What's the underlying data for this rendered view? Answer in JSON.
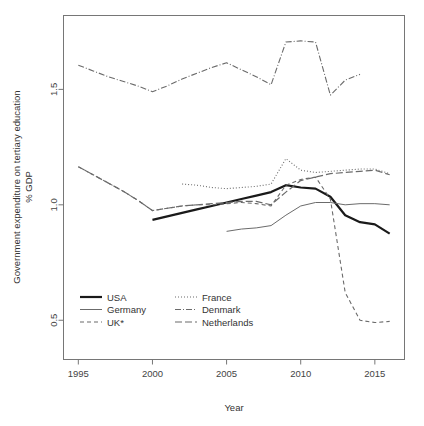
{
  "chart_data": {
    "type": "line",
    "title": "",
    "xlabel": "Year",
    "ylabel": "Government expenditure on tertiary education\n% GDP",
    "ylabel_line1": "Government expenditure on tertiary education",
    "ylabel_line2": "% GDP",
    "xlim": [
      1994,
      2017
    ],
    "ylim": [
      0.33,
      1.82
    ],
    "grid": false,
    "legend_position": "bottom-left",
    "xticks": [
      1995,
      2000,
      2005,
      2010,
      2015
    ],
    "xtick_labels": [
      "1995",
      "2000",
      "2005",
      "2010",
      "2015"
    ],
    "yticks": [
      0.5,
      1.0,
      1.5
    ],
    "ytick_labels": [
      "0.5",
      "1.0",
      "1.5"
    ],
    "series": [
      {
        "name": "USA",
        "style": "solid-thick",
        "color": "#1a1a1a",
        "width": 2.2,
        "dash": "",
        "x": [
          2000,
          2001,
          2002,
          2003,
          2004,
          2005,
          2006,
          2007,
          2008,
          2009,
          2010,
          2011,
          2012,
          2013,
          2014,
          2015,
          2016
        ],
        "y": [
          0.935,
          0.95,
          0.965,
          0.98,
          0.995,
          1.01,
          1.025,
          1.04,
          1.055,
          1.085,
          1.075,
          1.07,
          1.035,
          0.955,
          0.925,
          0.915,
          0.875
        ]
      },
      {
        "name": "Germany",
        "style": "solid-thin",
        "color": "#6b6b6b",
        "width": 1.0,
        "dash": "",
        "x": [
          2005,
          2006,
          2007,
          2008,
          2009,
          2010,
          2011,
          2012,
          2013,
          2014,
          2015,
          2016
        ],
        "y": [
          0.885,
          0.895,
          0.9,
          0.91,
          0.955,
          0.995,
          1.01,
          1.01,
          1.0,
          1.005,
          1.005,
          1.0
        ]
      },
      {
        "name": "UK*",
        "style": "dashed",
        "color": "#6b6b6b",
        "width": 1.1,
        "dash": "4,3",
        "x": [
          1995,
          1996,
          1997,
          1998,
          1999,
          2000,
          2001,
          2002,
          2003,
          2004,
          2005,
          2006,
          2007,
          2008,
          2009,
          2010,
          2011,
          2012,
          2013,
          2014,
          2015,
          2016
        ],
        "y": [
          1.165,
          1.13,
          1.095,
          1.06,
          1.02,
          0.975,
          0.985,
          0.995,
          1.0,
          1.0,
          1.005,
          1.01,
          1.005,
          0.995,
          1.085,
          1.11,
          1.12,
          1.025,
          0.62,
          0.5,
          0.49,
          0.495
        ]
      },
      {
        "name": "France",
        "style": "dotted",
        "color": "#6b6b6b",
        "width": 1.1,
        "dash": "1,2",
        "x": [
          2002,
          2003,
          2004,
          2005,
          2006,
          2007,
          2008,
          2009,
          2010,
          2011,
          2012,
          2013,
          2014,
          2015,
          2016
        ],
        "y": [
          1.09,
          1.085,
          1.075,
          1.07,
          1.075,
          1.08,
          1.09,
          1.2,
          1.15,
          1.14,
          1.145,
          1.15,
          1.155,
          1.155,
          1.135
        ]
      },
      {
        "name": "Denmark",
        "style": "dash-dot",
        "color": "#6b6b6b",
        "width": 1.1,
        "dash": "6,2,1,2",
        "x": [
          1995,
          1996,
          1997,
          1998,
          1999,
          2000,
          2001,
          2002,
          2003,
          2004,
          2005,
          2006,
          2007,
          2008,
          2009,
          2010,
          2011,
          2012,
          2013,
          2014
        ],
        "y": [
          1.605,
          1.58,
          1.555,
          1.535,
          1.515,
          1.49,
          1.515,
          1.545,
          1.57,
          1.595,
          1.615,
          1.585,
          1.555,
          1.52,
          1.705,
          1.71,
          1.705,
          1.475,
          1.54,
          1.565
        ]
      },
      {
        "name": "Netherlands",
        "style": "long-dash",
        "color": "#6b6b6b",
        "width": 1.2,
        "dash": "7,3",
        "x": [
          1995,
          1996,
          1997,
          1998,
          1999,
          2000,
          2001,
          2002,
          2003,
          2004,
          2005,
          2006,
          2007,
          2008,
          2009,
          2010,
          2011,
          2012,
          2013,
          2014,
          2015,
          2016
        ],
        "y": [
          1.165,
          1.13,
          1.095,
          1.06,
          1.02,
          0.975,
          0.985,
          0.995,
          1.0,
          1.005,
          1.01,
          1.015,
          1.015,
          1.0,
          1.055,
          1.105,
          1.12,
          1.135,
          1.14,
          1.145,
          1.15,
          1.13
        ]
      }
    ],
    "legend_entries": [
      {
        "label": "USA",
        "style": "solid-thick",
        "dash": "",
        "width": 2.2,
        "color": "#1a1a1a",
        "col": 0,
        "row": 0
      },
      {
        "label": "Germany",
        "style": "solid-thin",
        "dash": "",
        "width": 1.0,
        "color": "#6b6b6b",
        "col": 0,
        "row": 1
      },
      {
        "label": "UK*",
        "style": "dashed",
        "dash": "4,3",
        "width": 1.1,
        "color": "#6b6b6b",
        "col": 0,
        "row": 2
      },
      {
        "label": "France",
        "style": "dotted",
        "dash": "1,2",
        "width": 1.1,
        "color": "#6b6b6b",
        "col": 1,
        "row": 0
      },
      {
        "label": "Denmark",
        "style": "dash-dot",
        "dash": "6,2,1,2",
        "width": 1.1,
        "color": "#6b6b6b",
        "col": 1,
        "row": 1
      },
      {
        "label": "Netherlands",
        "style": "long-dash",
        "dash": "7,3",
        "width": 1.2,
        "color": "#6b6b6b",
        "col": 1,
        "row": 2
      }
    ]
  },
  "colors": {
    "background": "#ffffff",
    "axis": "#767676",
    "text": "#333333",
    "highlight_series": "#1a1a1a",
    "other_series": "#6b6b6b"
  }
}
